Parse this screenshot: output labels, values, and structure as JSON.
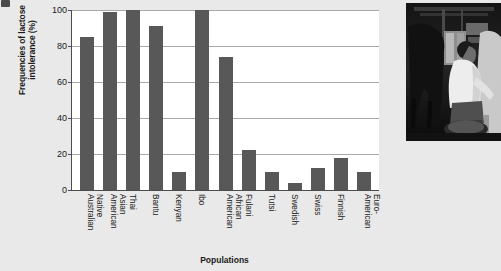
{
  "figure": {
    "marker": "figure-number-marker"
  },
  "chart_data": {
    "type": "bar",
    "title": "",
    "xlabel": "Populations",
    "ylabel": "Frequencies of lactose intolerance (%)",
    "ylabel_line1": "Frequencies of lactose",
    "ylabel_line2": "intolerance (%)",
    "ylim": [
      0,
      100
    ],
    "yticks": [
      0,
      20,
      40,
      60,
      80,
      100
    ],
    "grid": "horizontal",
    "legend": "none",
    "bar_color": "#585858",
    "plot_background": "#ffffff",
    "page_background": "#e9e9e9",
    "categories": [
      "Native Australian",
      "Asian American",
      "Thai",
      "Bantu",
      "Kenyan",
      "Ibo",
      "African American",
      "Fulani",
      "Tutsi",
      "Swedish",
      "Swiss",
      "Finnish",
      "Euro-American"
    ],
    "category_lines": [
      [
        "Native",
        "Australian"
      ],
      [
        "Asian",
        "American"
      ],
      [
        "Thai",
        ""
      ],
      [
        "Bantu",
        ""
      ],
      [
        "Kenyan",
        ""
      ],
      [
        "Ibo",
        ""
      ],
      [
        "African",
        "American"
      ],
      [
        "Fulani",
        ""
      ],
      [
        "Tutsi",
        ""
      ],
      [
        "Swedish",
        ""
      ],
      [
        "Swiss",
        ""
      ],
      [
        "Finnish",
        ""
      ],
      [
        "Euro-",
        "American"
      ]
    ],
    "values": [
      85,
      99,
      100,
      91,
      10,
      100,
      74,
      22,
      10,
      4,
      12,
      18,
      10
    ]
  },
  "photo": {
    "alt": "Black and white photograph of a man milking a cow inside a barn",
    "name": "milking-cow-photograph"
  }
}
